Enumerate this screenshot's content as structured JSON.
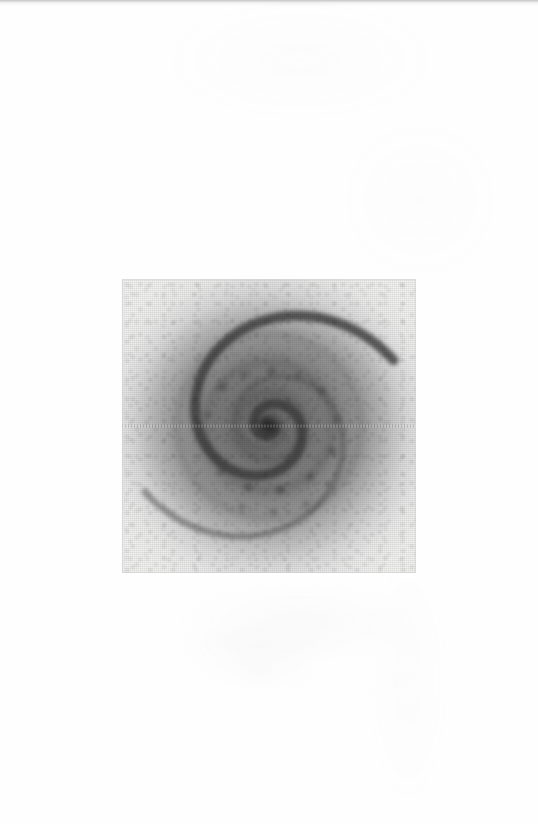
{
  "page": {
    "kind": "scanned-photographic-plate-page",
    "background_color": "#fefefe",
    "width_px": 538,
    "height_px": 824,
    "top_edge_band_color": "#c4c4c6",
    "caption_text": "",
    "page_number_text": "",
    "header_text": "",
    "footer_text": ""
  },
  "plate": {
    "label": "",
    "panel": {
      "x_px": 122,
      "y_px": 279,
      "width_px": 294,
      "height_px": 294,
      "border_color": "#cdcdcd",
      "base_color": "#f2f2f1"
    },
    "halo": {
      "center_x_pct": 50.5,
      "center_y_pct": 50.5,
      "core_color": "#6c6c6c",
      "mid_color": "#919192",
      "edge_color": "#ececec",
      "outer_radius_pct": 95
    },
    "artifacts": {
      "scanline_label": "horizontal scan-line artifact",
      "scanline_y_pct": 50,
      "grain_label": "granular emulsion texture"
    }
  },
  "chart_data": {
    "type": "scatter",
    "title": "",
    "subtitle": "",
    "xlabel": "",
    "ylabel": "",
    "grid": false,
    "legend_position": "none",
    "render_hint": "logarithmic-two-arm-spiral-on-radial-halo",
    "xlim": [
      -1,
      1
    ],
    "ylim": [
      -1,
      1
    ],
    "spiral": {
      "center": [
        0.5,
        0.5
      ],
      "turns": 2.05,
      "arm_count": 2,
      "a": 0.022,
      "b": 0.255,
      "theta_start_deg": 10,
      "theta_end_deg": 760,
      "arm_offset_deg": 180,
      "stroke_color": "#3b3b3b",
      "stroke_color_outer": "#5f5f5f",
      "stroke_width_inner_px": 10,
      "stroke_width_outer_px": 6
    },
    "core": {
      "center": [
        0.5,
        0.5
      ],
      "radius_px": 13,
      "color": "#2b2b2b"
    },
    "rings": [
      {
        "name": "inner-ring",
        "radius_px": 34,
        "color": "#454545",
        "width_px": 9,
        "opacity": 0.88
      },
      {
        "name": "middle-ring",
        "radius_px": 64,
        "color": "#4e4e4e",
        "width_px": 8,
        "opacity": 0.8
      },
      {
        "name": "outer-ring",
        "radius_px": 92,
        "color": "#6a6a6a",
        "width_px": 6,
        "opacity": 0.45
      }
    ],
    "series": [
      {
        "name": "radial-brightness-profile",
        "x": [
          0,
          10,
          20,
          30,
          40,
          50,
          60,
          70,
          80,
          90,
          100,
          110,
          120,
          130,
          140
        ],
        "values": [
          28,
          38,
          52,
          48,
          62,
          58,
          70,
          66,
          78,
          84,
          104,
          128,
          164,
          206,
          240
        ],
        "units": "8-bit grey level"
      }
    ],
    "annotations": []
  }
}
